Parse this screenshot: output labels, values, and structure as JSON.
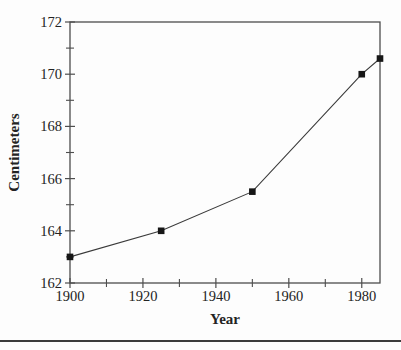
{
  "figure": {
    "kind": "scanned textbook line chart, monochrome",
    "background": "#fdfdfd"
  },
  "chart_data": {
    "type": "line",
    "title": "",
    "xlabel": "Year",
    "ylabel": "Centimeters",
    "x": [
      1900,
      1925,
      1950,
      1980,
      1985
    ],
    "y": [
      163,
      164,
      165.5,
      170,
      170.6
    ],
    "xlim": [
      1900,
      1985
    ],
    "ylim": [
      162,
      172
    ],
    "x_major_ticks": [
      1900,
      1920,
      1940,
      1960,
      1980
    ],
    "x_tick_labels": [
      "1900",
      "1920",
      "1940",
      "1960",
      "1980"
    ],
    "x_minor_ticks": [
      1910,
      1930,
      1950,
      1970
    ],
    "y_major_ticks": [
      162,
      164,
      166,
      168,
      170,
      172
    ],
    "y_tick_labels": [
      "162",
      "164",
      "166",
      "168",
      "170",
      "172"
    ],
    "y_minor_ticks": [
      163,
      165,
      167,
      169,
      171
    ],
    "grid": false,
    "legend": null,
    "frame": "closed box",
    "marker": "filled-square",
    "colors": {
      "line": "#3a3a3a",
      "marker": "#161616",
      "axis": "#4d4d4d",
      "text": "#232323",
      "rule": "#3c3c3c"
    }
  },
  "page": {
    "bottom_rule": "horizontal separator line across full page width"
  }
}
